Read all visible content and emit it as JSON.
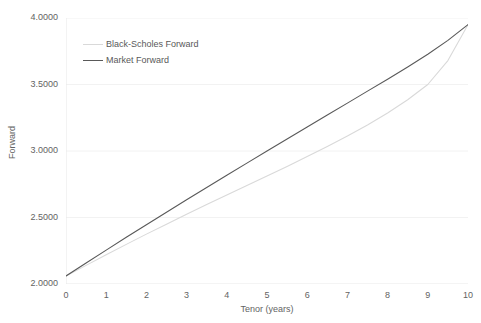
{
  "chart_data": {
    "type": "line",
    "title": "",
    "xlabel": "Tenor (years)",
    "ylabel": "Forward",
    "xlim": [
      0,
      10
    ],
    "ylim": [
      2.0,
      4.0
    ],
    "grid": "horizontal",
    "legend_position": "top-left-inside",
    "x_ticks": [
      "0",
      "1",
      "2",
      "3",
      "4",
      "5",
      "6",
      "7",
      "8",
      "9",
      "10"
    ],
    "y_ticks": [
      "2.0000",
      "2.5000",
      "3.0000",
      "3.5000",
      "4.0000"
    ],
    "x": [
      0,
      0.5,
      1,
      1.5,
      2,
      2.5,
      3,
      3.5,
      4,
      4.5,
      5,
      5.5,
      6,
      6.5,
      7,
      7.5,
      8,
      8.5,
      9,
      9.5,
      10
    ],
    "series": [
      {
        "name": "Black-Scholes Forward",
        "color": "#d9d9d9",
        "values": [
          2.06,
          2.14,
          2.22,
          2.298,
          2.375,
          2.45,
          2.524,
          2.597,
          2.669,
          2.74,
          2.812,
          2.884,
          2.958,
          3.034,
          3.113,
          3.196,
          3.286,
          3.385,
          3.5,
          3.68,
          3.95
        ]
      },
      {
        "name": "Market Forward",
        "color": "#595959",
        "values": [
          2.06,
          2.158,
          2.255,
          2.351,
          2.446,
          2.54,
          2.633,
          2.726,
          2.818,
          2.909,
          3.0,
          3.09,
          3.18,
          3.27,
          3.36,
          3.45,
          3.54,
          3.632,
          3.727,
          3.832,
          3.95
        ]
      }
    ]
  },
  "axes": {
    "y_title": "Forward",
    "x_title": "Tenor (years)",
    "y_tick_labels": [
      "2.0000",
      "2.5000",
      "3.0000",
      "3.5000",
      "4.0000"
    ],
    "x_tick_labels": [
      "0",
      "1",
      "2",
      "3",
      "4",
      "5",
      "6",
      "7",
      "8",
      "9",
      "10"
    ]
  },
  "legend": {
    "items": [
      {
        "label": "Black-Scholes Forward",
        "color": "#d9d9d9"
      },
      {
        "label": "Market Forward",
        "color": "#595959"
      }
    ]
  },
  "colors": {
    "background": "#ffffff",
    "gridline": "#f2f2f2",
    "axis_line": "#e8e8e8",
    "tick_text": "#636363",
    "series_light": "#d9d9d9",
    "series_dark": "#595959"
  }
}
